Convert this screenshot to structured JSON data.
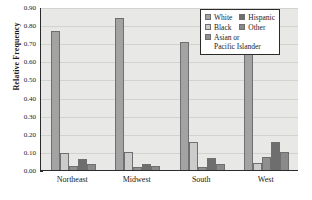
{
  "chart_data": {
    "type": "bar",
    "title": "",
    "xlabel": "",
    "ylabel": "Relative Frequency",
    "ylim": [
      0.0,
      0.9
    ],
    "ytick_labels": [
      "0.90",
      "0.80",
      "0.70",
      "0.60",
      "0.50",
      "0.40",
      "0.30",
      "0.20",
      "0.10",
      "0.00"
    ],
    "ytick_values": [
      0.9,
      0.8,
      0.7,
      0.6,
      0.5,
      0.4,
      0.3,
      0.2,
      0.1,
      0.0
    ],
    "grid": true,
    "legend_position": "top-right",
    "categories": [
      "Northeast",
      "Midwest",
      "South",
      "West"
    ],
    "series": [
      {
        "name": "White",
        "color": "#a3a3a3",
        "values": [
          0.765,
          0.84,
          0.708,
          0.642
        ]
      },
      {
        "name": "Black",
        "color": "#cccccc",
        "values": [
          0.095,
          0.098,
          0.152,
          0.037
        ]
      },
      {
        "name": "Asian or Pacific Islander",
        "color": "#8f8f8f",
        "values": [
          0.022,
          0.015,
          0.014,
          0.072
        ]
      },
      {
        "name": "Hispanic",
        "color": "#6e6e6e",
        "values": [
          0.059,
          0.034,
          0.068,
          0.152
        ]
      },
      {
        "name": "Other",
        "color": "#8a8a8a",
        "values": [
          0.033,
          0.022,
          0.032,
          0.098
        ]
      }
    ]
  },
  "legend": {
    "entries": [
      {
        "label": "White",
        "color": "#a3a3a3"
      },
      {
        "label": "Hispanic",
        "color": "#6e6e6e"
      },
      {
        "label": "Black",
        "color": "#cccccc"
      },
      {
        "label": "Other",
        "color": "#8a8a8a"
      },
      {
        "label": "Asian or",
        "label2": "Pacific Islander",
        "color": "#8f8f8f"
      }
    ]
  }
}
